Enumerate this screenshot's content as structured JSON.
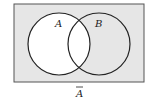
{
  "diagram": {
    "type": "venn",
    "universe": {
      "x": 14,
      "y": 4,
      "width": 130,
      "height": 78,
      "fill": "#e6e6e6",
      "stroke": "#555555"
    },
    "sets": [
      {
        "label": "A",
        "cx": 59,
        "cy": 44,
        "r": 31,
        "fill": "#ffffff"
      },
      {
        "label": "B",
        "cx": 99,
        "cy": 44,
        "r": 31
      }
    ],
    "shaded_region": "complement of A",
    "caption": "A",
    "caption_has_overbar": true
  }
}
